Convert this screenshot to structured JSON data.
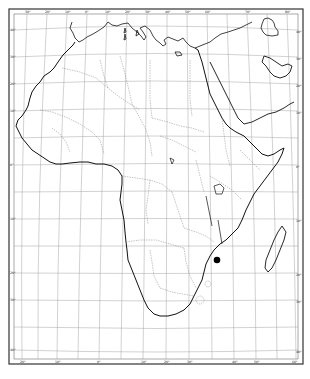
{
  "map": {
    "subject": "Africa",
    "style": "black-and-white outline map",
    "colors": {
      "background": "#ffffff",
      "coastline": "#111111",
      "border": "#888888",
      "graticule": "#9a9a9a",
      "frame": "#333333",
      "marker": "#000000"
    },
    "graticule": {
      "top_ticks": [
        "30°",
        "20°",
        "10°",
        "0°",
        "10°",
        "20°",
        "30°",
        "40°",
        "50°",
        "60°",
        "70°",
        "80°"
      ],
      "bottom_ticks": [
        "20°",
        "10°",
        "0°",
        "10°",
        "20°",
        "30°",
        "40°",
        "50°",
        "60°"
      ],
      "left_ticks": [
        "40°",
        "30°",
        "20°",
        "10°",
        "0°",
        "10°",
        "20°",
        "30°",
        "40°"
      ],
      "right_ticks": [
        "40°",
        "30°",
        "20°",
        "10°",
        "0°",
        "10°",
        "20°",
        "30°",
        "40°"
      ]
    },
    "markers": [
      {
        "name": "location-marker",
        "shape": "filled circle",
        "region": "southeastern Africa (Zimbabwe/Mozambique border area)"
      }
    ]
  }
}
